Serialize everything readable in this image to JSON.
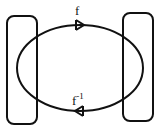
{
  "diagram": {
    "type": "mapping-diagram",
    "stroke_color": "#111111",
    "background_color": "#ffffff",
    "nodes": [
      {
        "id": "left-set",
        "shape": "rounded-rectangle"
      },
      {
        "id": "right-set",
        "shape": "rounded-rectangle"
      }
    ],
    "edges": [
      {
        "id": "forward",
        "from": "left-set",
        "to": "right-set",
        "label": "f",
        "arrow_direction": "right",
        "position": "top"
      },
      {
        "id": "inverse",
        "from": "right-set",
        "to": "left-set",
        "label_base": "f",
        "label_superscript": "-1",
        "arrow_direction": "left",
        "position": "bottom"
      }
    ]
  }
}
